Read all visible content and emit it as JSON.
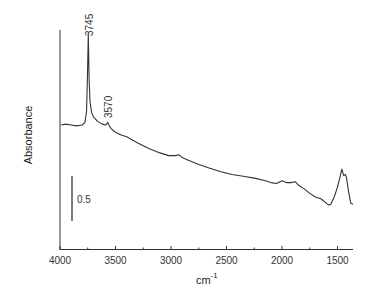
{
  "chart_data": {
    "type": "line",
    "title": "",
    "xlabel": "cm⁻¹",
    "xlabel_base": "cm",
    "xlabel_sup": "-1",
    "ylabel": "Absorbance",
    "xlim": [
      4000,
      1350
    ],
    "x_reversed": true,
    "xticks": [
      4000,
      3500,
      3000,
      2500,
      2000,
      1500
    ],
    "xtick_labels": [
      "4000",
      "3500",
      "3000",
      "2500",
      "2000",
      "1500"
    ],
    "minor_xticks": [
      3750,
      3250,
      2750,
      2250,
      1750
    ],
    "yticks": [],
    "grid": false,
    "legend": null,
    "scale_bar": {
      "label": "0.5",
      "value": 0.5
    },
    "annotations": [
      {
        "text": "3745",
        "x": 3745
      },
      {
        "text": "3570",
        "x": 3570
      }
    ],
    "series": [
      {
        "name": "Absorbance spectrum",
        "color": "#333333",
        "x": [
          3990,
          3950,
          3900,
          3850,
          3800,
          3775,
          3760,
          3752,
          3745,
          3738,
          3730,
          3715,
          3700,
          3660,
          3620,
          3590,
          3575,
          3570,
          3560,
          3540,
          3500,
          3450,
          3400,
          3300,
          3200,
          3100,
          3020,
          2960,
          2930,
          2900,
          2850,
          2750,
          2650,
          2550,
          2450,
          2350,
          2250,
          2150,
          2100,
          2050,
          2000,
          1960,
          1920,
          1880,
          1850,
          1800,
          1750,
          1700,
          1650,
          1610,
          1580,
          1560,
          1530,
          1500,
          1470,
          1460,
          1445,
          1430,
          1420,
          1400,
          1380,
          1360
        ],
        "y": [
          1.04,
          1.05,
          1.04,
          1.03,
          1.04,
          1.07,
          1.2,
          1.6,
          2.05,
          1.55,
          1.3,
          1.18,
          1.13,
          1.08,
          1.05,
          1.04,
          1.06,
          1.07,
          1.04,
          1.0,
          0.96,
          0.93,
          0.91,
          0.84,
          0.78,
          0.73,
          0.7,
          0.7,
          0.71,
          0.68,
          0.65,
          0.6,
          0.56,
          0.52,
          0.49,
          0.47,
          0.45,
          0.42,
          0.4,
          0.39,
          0.42,
          0.4,
          0.4,
          0.41,
          0.37,
          0.33,
          0.28,
          0.24,
          0.22,
          0.18,
          0.15,
          0.16,
          0.24,
          0.35,
          0.5,
          0.55,
          0.48,
          0.49,
          0.46,
          0.3,
          0.17,
          0.16
        ]
      }
    ]
  }
}
